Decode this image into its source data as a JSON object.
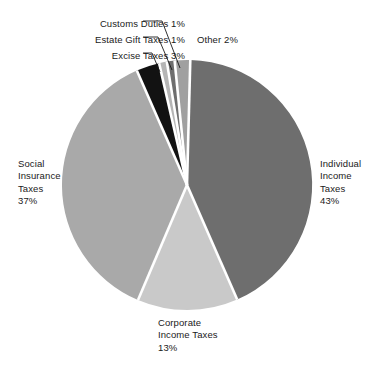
{
  "chart_data": {
    "type": "pie",
    "title": "",
    "subtitle": "",
    "xlabel": "",
    "ylabel": "",
    "legend_position": "none",
    "grid": false,
    "labels_inline": true,
    "categories": [
      "Individual Income Taxes",
      "Corporate Income Taxes",
      "Social Insurance Taxes",
      "Excise Taxes",
      "Estate Gift Taxes",
      "Customs Duties",
      "Other"
    ],
    "values": [
      43,
      13,
      37,
      3,
      1,
      1,
      2
    ],
    "slices": [
      {
        "name": "Individual Income Taxes",
        "value": 43,
        "value_label": "43%",
        "color": "#6e6e6e",
        "start_angle_deg": 1.5,
        "end_angle_deg": 156.3
      },
      {
        "name": "Corporate Income Taxes",
        "value": 13,
        "value_label": "13%",
        "color": "#c9c9c9",
        "start_angle_deg": 156.3,
        "end_angle_deg": 203.1
      },
      {
        "name": "Social Insurance Taxes",
        "value": 37,
        "value_label": "37%",
        "color": "#a9a9a9",
        "start_angle_deg": 203.1,
        "end_angle_deg": 336.3
      },
      {
        "name": "Excise Taxes",
        "value": 3,
        "value_label": "3%",
        "color": "#121212",
        "start_angle_deg": 336.3,
        "end_angle_deg": 347.1
      },
      {
        "name": "Estate Gift Taxes",
        "value": 1,
        "value_label": "1%",
        "color": "#b5b5b5",
        "start_angle_deg": 347.1,
        "end_angle_deg": 350.7
      },
      {
        "name": "Customs Duties",
        "value": 1,
        "value_label": "1%",
        "color": "#6e6e6e",
        "start_angle_deg": 350.7,
        "end_angle_deg": 354.3
      },
      {
        "name": "Other",
        "value": 2,
        "value_label": "2%",
        "color": "#a0a0a0",
        "start_angle_deg": 354.3,
        "end_angle_deg": 361.5
      }
    ]
  },
  "labels": {
    "customs_duties": "Customs Duties 1%",
    "estate_gift_taxes": "Estate Gift Taxes 1%",
    "excise_taxes": "Excise Taxes 3%",
    "other": "Other 2%",
    "individual_income": {
      "line1": "Individual",
      "line2": "Income",
      "line3": "Taxes",
      "line4": "43%"
    },
    "social_insurance": {
      "line1": "Social",
      "line2": "Insurance",
      "line3": "Taxes",
      "line4": "37%"
    },
    "corporate_income": {
      "line1": "Corporate",
      "line2": "Income Taxes",
      "line3": "13%"
    }
  },
  "colors": {
    "individual": "#6e6e6e",
    "corporate": "#c9c9c9",
    "social": "#a9a9a9",
    "excise": "#121212",
    "estate": "#b5b5b5",
    "customs": "#6e6e6e",
    "other": "#a0a0a0",
    "separator": "#ffffff",
    "leader_line": "#1a1a1a",
    "text": "#1a1a1a",
    "background": "#ffffff"
  }
}
